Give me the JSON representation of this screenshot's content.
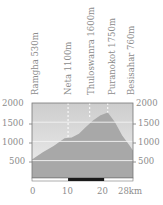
{
  "chart_data": {
    "type": "area",
    "title": "",
    "xlabel": "km",
    "ylabel": "m",
    "xlim": [
      0,
      28
    ],
    "ylim": [
      0,
      2000
    ],
    "grid": true,
    "x": [
      0,
      3,
      6,
      9,
      11,
      13,
      15,
      17,
      19,
      21,
      23,
      25,
      27,
      28
    ],
    "values": [
      530,
      720,
      880,
      1080,
      1100,
      1200,
      1380,
      1550,
      1680,
      1750,
      1500,
      1150,
      900,
      760
    ],
    "y_ticks": [
      "2000",
      "1500",
      "1000",
      "500"
    ],
    "x_ticks": [
      "0",
      "10",
      "20",
      "28km"
    ],
    "waypoints": [
      {
        "name": "Ramgha 530m",
        "km": 0,
        "elev": 530
      },
      {
        "name": "Neta 1100m",
        "km": 10,
        "elev": 1100
      },
      {
        "name": "Thuloswanra 1600m",
        "km": 16,
        "elev": 1600
      },
      {
        "name": "Puranokot 1750m",
        "km": 21,
        "elev": 1750
      },
      {
        "name": "Besisahar 760m",
        "km": 28,
        "elev": 760
      }
    ],
    "scale_bar": {
      "from_km": 10,
      "to_km": 20
    }
  },
  "colors": {
    "area_fill": "#a8a8a8",
    "sky_top": "#cfcfcf",
    "sky_bottom": "#ececec",
    "grid": "#f4f4f4",
    "frame": "#707070",
    "scale_bar": "#1a1a1a",
    "text": "#8c8c8c"
  }
}
